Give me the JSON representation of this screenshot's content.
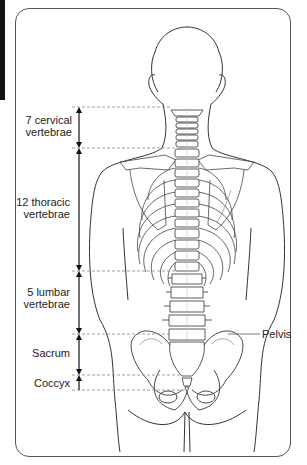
{
  "figure": {
    "regions": [
      {
        "id": "cervical",
        "line1": "7 cervical",
        "line2": "vertebrae"
      },
      {
        "id": "thoracic",
        "line1": "12 thoracic",
        "line2": "vertebrae"
      },
      {
        "id": "lumbar",
        "line1": "5 lumbar",
        "line2": "vertebrae"
      },
      {
        "id": "sacrum",
        "line1": "Sacrum"
      },
      {
        "id": "coccyx",
        "line1": "Coccyx"
      }
    ],
    "callouts": [
      {
        "id": "pelvis",
        "label": "Pelvis"
      }
    ],
    "colors": {
      "line": "#333333",
      "dash": "#888888",
      "frame": "#555555",
      "arrow": "#111111"
    }
  }
}
